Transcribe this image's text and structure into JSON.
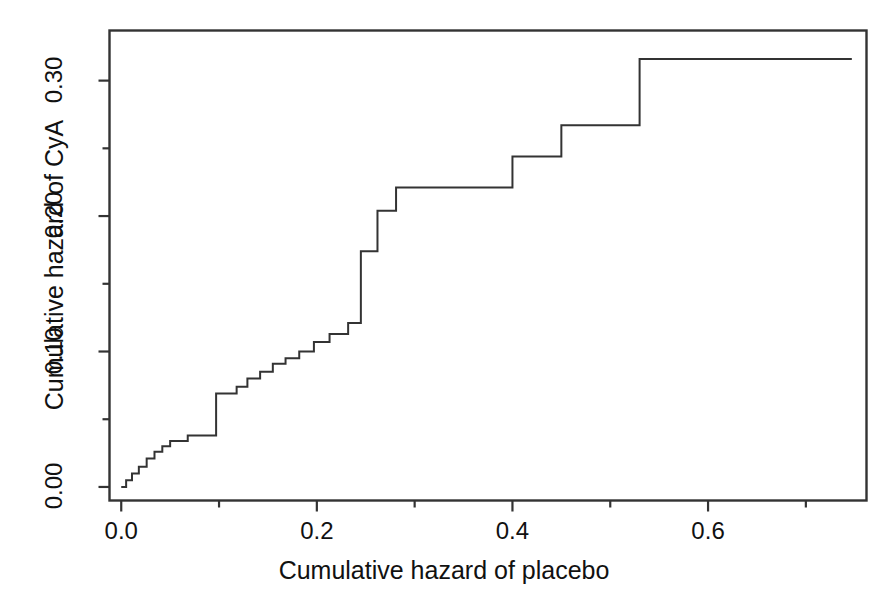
{
  "chart_data": {
    "type": "line",
    "subtype": "step-post",
    "title": "",
    "xlabel": "Cumulative hazard of placebo",
    "ylabel": "Cumulative hazard of CyA",
    "xlim": [
      -0.012,
      0.762
    ],
    "ylim": [
      -0.01,
      0.337
    ],
    "xticks": [
      0.0,
      0.2,
      0.4,
      0.6
    ],
    "xtick_labels": [
      "0.0",
      "0.2",
      "0.4",
      "0.6"
    ],
    "xminor_ticks": [
      0.1,
      0.3,
      0.5,
      0.7
    ],
    "yticks": [
      0.0,
      0.1,
      0.2,
      0.3
    ],
    "ytick_labels": [
      "0.00",
      "0.10",
      "0.20",
      "0.30"
    ],
    "yminor_ticks": [
      0.05,
      0.15,
      0.25
    ],
    "grid": false,
    "legend": null,
    "line_color": "#333333",
    "line_width": 2.0,
    "background_color": "#ffffff",
    "frame": true,
    "series": [
      {
        "name": "Cumulative hazard CyA vs placebo",
        "x": [
          0.0,
          0.005,
          0.005,
          0.011,
          0.011,
          0.018,
          0.018,
          0.026,
          0.026,
          0.034,
          0.034,
          0.042,
          0.042,
          0.05,
          0.05,
          0.058,
          0.058,
          0.068,
          0.068,
          0.079,
          0.079,
          0.097,
          0.097,
          0.118,
          0.118,
          0.129,
          0.129,
          0.142,
          0.142,
          0.155,
          0.155,
          0.168,
          0.168,
          0.182,
          0.182,
          0.197,
          0.197,
          0.213,
          0.213,
          0.232,
          0.232,
          0.245,
          0.245,
          0.262,
          0.262,
          0.281,
          0.281,
          0.4,
          0.4,
          0.45,
          0.45,
          0.53,
          0.53,
          0.747
        ],
        "y": [
          0.0,
          0.0,
          0.005,
          0.005,
          0.01,
          0.01,
          0.015,
          0.015,
          0.021,
          0.021,
          0.026,
          0.026,
          0.03,
          0.03,
          0.034,
          0.034,
          0.034,
          0.034,
          0.038,
          0.038,
          0.038,
          0.038,
          0.069,
          0.069,
          0.074,
          0.074,
          0.08,
          0.08,
          0.085,
          0.085,
          0.091,
          0.091,
          0.095,
          0.095,
          0.1,
          0.1,
          0.107,
          0.107,
          0.113,
          0.113,
          0.121,
          0.121,
          0.174,
          0.174,
          0.204,
          0.204,
          0.221,
          0.221,
          0.244,
          0.244,
          0.267,
          0.267,
          0.316,
          0.316
        ]
      }
    ]
  }
}
